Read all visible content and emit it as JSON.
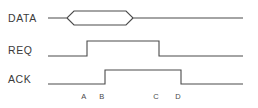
{
  "diagram": {
    "type": "timing-diagram",
    "background_color": "#ffffff",
    "line_color": "#4a4a4a",
    "text_color": "#3b3b3b",
    "signals": [
      {
        "name": "DATA",
        "label": "DATA",
        "kind": "bus",
        "baseline_y": 18,
        "high_y": 11,
        "low_y": 25,
        "start_x": 48,
        "end_x": 243,
        "valid_start_x": 67,
        "valid_end_x": 133,
        "transition_width": 7
      },
      {
        "name": "REQ",
        "label": "REQ",
        "kind": "logic",
        "low_y": 56,
        "high_y": 41,
        "start_x": 48,
        "end_x": 243,
        "rising_edge_x": 87,
        "falling_edge_x": 159
      },
      {
        "name": "ACK",
        "label": "ACK",
        "kind": "logic",
        "low_y": 84,
        "high_y": 70,
        "start_x": 48,
        "end_x": 243,
        "rising_edge_x": 105,
        "falling_edge_x": 181
      }
    ],
    "label_x": 8,
    "label_positions": {
      "DATA": 19,
      "REQ": 51,
      "ACK": 80
    },
    "markers": [
      {
        "label": "A",
        "x": 84,
        "y": 99
      },
      {
        "label": "B",
        "x": 102,
        "y": 99
      },
      {
        "label": "C",
        "x": 156,
        "y": 99
      },
      {
        "label": "D",
        "x": 178,
        "y": 99
      }
    ]
  }
}
